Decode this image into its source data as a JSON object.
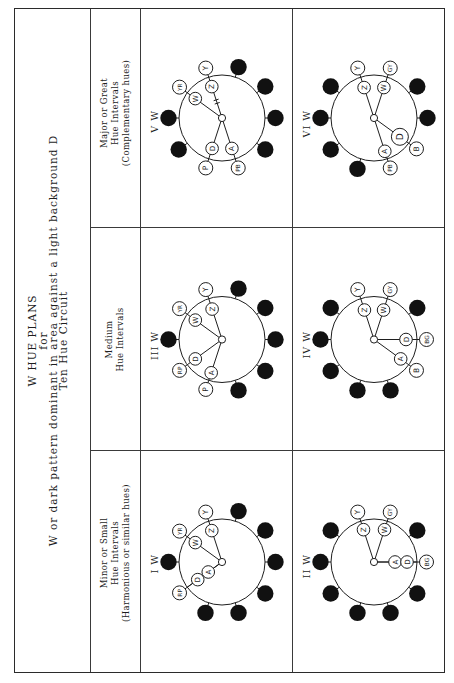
{
  "title": {
    "line1": "W HUE PLANS",
    "line2": "for",
    "line3": "W or dark pattern dominant in area against a light background D",
    "line4": "Ten Hue Circuit"
  },
  "columns": [
    {
      "key": "minor",
      "header": [
        "Minor or Small",
        "Hue Intervals",
        "(Harmonious or similar hues)"
      ]
    },
    {
      "key": "medium",
      "header": [
        "Medium",
        "Hue Intervals"
      ]
    },
    {
      "key": "major",
      "header": [
        "Major or Great",
        "Hue Intervals",
        "(Complementary hues)"
      ]
    }
  ],
  "colors": {
    "ink": "#1e1e1e",
    "dot": "#111111",
    "paper": "#ffffff",
    "rule": "#3a3a3a"
  },
  "diagrams": [
    {
      "label": "I W",
      "row": 1,
      "column": "minor",
      "ring": [
        null,
        "YR",
        "Y",
        null,
        null,
        null,
        null,
        null,
        null,
        "RP"
      ],
      "nodes": [
        {
          "symbol": "W",
          "pos": 1,
          "r": 33
        },
        {
          "symbol": "Z",
          "pos": 2,
          "r": 33
        },
        {
          "symbol": "A",
          "pos": 9,
          "r": 17
        },
        {
          "symbol": "D",
          "pos": 9,
          "r": 30
        }
      ]
    },
    {
      "label": "III W",
      "row": 1,
      "column": "medium",
      "ring": [
        null,
        "YR",
        "Y",
        null,
        null,
        null,
        null,
        null,
        "P",
        "RP"
      ],
      "nodes": [
        {
          "symbol": "W",
          "pos": 1,
          "r": 33
        },
        {
          "symbol": "Z",
          "pos": 2,
          "r": 32
        },
        {
          "symbol": "D",
          "pos": 9,
          "r": 33
        },
        {
          "symbol": "A",
          "pos": 8,
          "r": 35
        }
      ]
    },
    {
      "label": "V W",
      "row": 1,
      "column": "major",
      "ring": [
        null,
        "YR",
        "Y",
        null,
        null,
        null,
        null,
        "PB",
        "P",
        null
      ],
      "nodes": [
        {
          "symbol": "W",
          "pos": 1,
          "r": 33
        },
        {
          "symbol": "Z",
          "pos": 2,
          "r": 33,
          "broken": true
        },
        {
          "symbol": "D",
          "pos": 8,
          "r": 32
        },
        {
          "symbol": "A",
          "pos": 7,
          "r": 32
        }
      ]
    },
    {
      "label": "II W",
      "row": 2,
      "column": "minor",
      "ring": [
        null,
        null,
        "Y",
        "GY",
        null,
        "BG",
        null,
        null,
        null,
        null
      ],
      "nodes": [
        {
          "symbol": "Z",
          "pos": 2,
          "r": 34
        },
        {
          "symbol": "W",
          "pos": 3,
          "r": 34
        },
        {
          "symbol": "A",
          "pos": 5,
          "r": 21
        },
        {
          "symbol": "D",
          "pos": 5,
          "r": 33
        }
      ]
    },
    {
      "label": "IV W",
      "row": 2,
      "column": "medium",
      "ring": [
        null,
        null,
        "Y",
        "GY",
        null,
        "BG",
        "B",
        null,
        null,
        null
      ],
      "nodes": [
        {
          "symbol": "Z",
          "pos": 2,
          "r": 31
        },
        {
          "symbol": "W",
          "pos": 3,
          "r": 31
        },
        {
          "symbol": "D",
          "pos": 5,
          "r": 32
        },
        {
          "symbol": "A",
          "pos": 6,
          "r": 33
        }
      ]
    },
    {
      "label": "VI W",
      "row": 2,
      "column": "major",
      "ring": [
        null,
        null,
        "Y",
        "GY",
        null,
        null,
        "B",
        "PB",
        null,
        null
      ],
      "nodes": [
        {
          "symbol": "Z",
          "pos": 2,
          "r": 32
        },
        {
          "symbol": "W",
          "pos": 3,
          "r": 32
        },
        {
          "symbol": "D",
          "pos": 6,
          "r": 32,
          "large": true
        },
        {
          "symbol": "A",
          "pos": 7,
          "r": 35
        }
      ]
    }
  ]
}
